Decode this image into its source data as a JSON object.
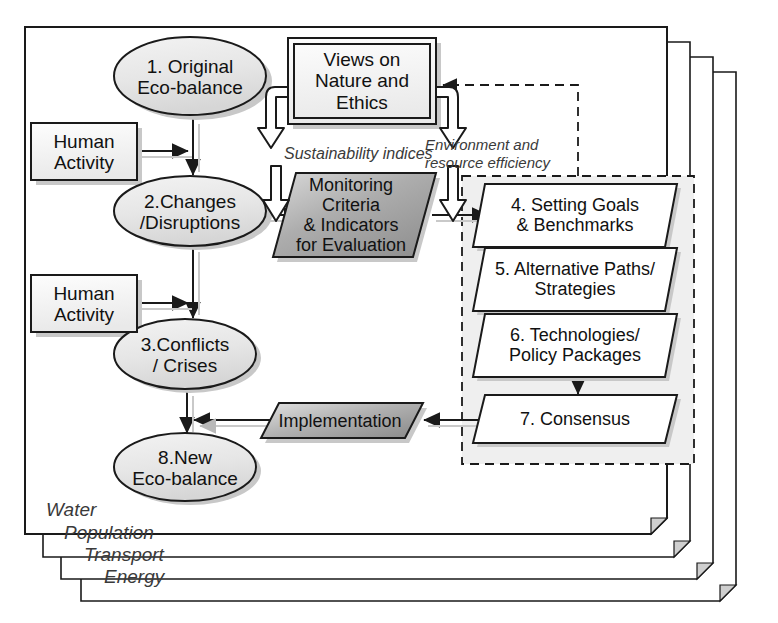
{
  "diagram": {
    "layers": [
      {
        "id": "water",
        "label": "Water"
      },
      {
        "id": "population",
        "label": "Population"
      },
      {
        "id": "transport",
        "label": "Transport"
      },
      {
        "id": "energy",
        "label": "Energy"
      }
    ],
    "nodes": {
      "eco_original": {
        "label": "1. Original\nEco-balance",
        "shape": "ellipse"
      },
      "human_activity_1": {
        "label": "Human\nActivity",
        "shape": "rect"
      },
      "human_activity_2": {
        "label": "Human\nActivity",
        "shape": "rect"
      },
      "changes": {
        "label": "2.Changes\n/Disruptions",
        "shape": "ellipse"
      },
      "conflicts": {
        "label": "3.Conflicts\n/ Crises",
        "shape": "ellipse"
      },
      "eco_new": {
        "label": "8.New\nEco-balance",
        "shape": "ellipse"
      },
      "views": {
        "label": "Views on\nNature and\nEthics",
        "shape": "double-rect"
      },
      "monitoring": {
        "label": "Monitoring\nCriteria\n& Indicators\nfor Evaluation",
        "shape": "parallelogram"
      },
      "goals": {
        "label": "4. Setting Goals\n& Benchmarks",
        "shape": "parallelogram"
      },
      "alternatives": {
        "label": "5. Alternative Paths/\nStrategies",
        "shape": "parallelogram"
      },
      "technologies": {
        "label": "6. Technologies/\nPolicy Packages",
        "shape": "parallelogram"
      },
      "consensus": {
        "label": "7. Consensus",
        "shape": "parallelogram"
      },
      "implementation": {
        "label": "Implementation",
        "shape": "parallelogram"
      }
    },
    "annotations": {
      "sustainability": "Sustainability indices",
      "efficiency": "Environment and\nresource efficiency"
    },
    "colors": {
      "ellipse_fill": "#e8e8e8",
      "monitoring_fill": "#a9a9a9",
      "implementation_fill": "#a9a9a9",
      "node_fill": "#ffffff",
      "stroke": "#1a1a1a",
      "shadow": "#bfbfbf",
      "dashed_stroke": "#1a1a1a",
      "annotation_text": "#3a3a3a"
    }
  }
}
